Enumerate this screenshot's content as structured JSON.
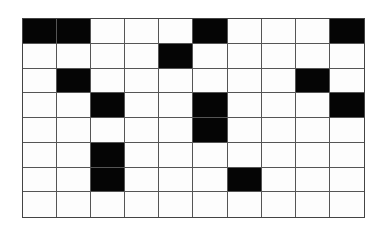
{
  "grid": {
    "rows": 8,
    "cols": 10,
    "filled_color": "#050505",
    "empty_color": "#fdfdfd",
    "line_color": "#555555",
    "cells": [
      [
        1,
        1,
        0,
        0,
        0,
        1,
        0,
        0,
        0,
        1
      ],
      [
        0,
        0,
        0,
        0,
        1,
        0,
        0,
        0,
        0,
        0
      ],
      [
        0,
        1,
        0,
        0,
        0,
        0,
        0,
        0,
        1,
        0
      ],
      [
        0,
        0,
        1,
        0,
        0,
        1,
        0,
        0,
        0,
        1
      ],
      [
        0,
        0,
        0,
        0,
        0,
        1,
        0,
        0,
        0,
        0
      ],
      [
        0,
        0,
        1,
        0,
        0,
        0,
        0,
        0,
        0,
        0
      ],
      [
        0,
        0,
        1,
        0,
        0,
        0,
        1,
        0,
        0,
        0
      ],
      [
        0,
        0,
        0,
        0,
        0,
        0,
        0,
        0,
        0,
        0
      ]
    ]
  }
}
